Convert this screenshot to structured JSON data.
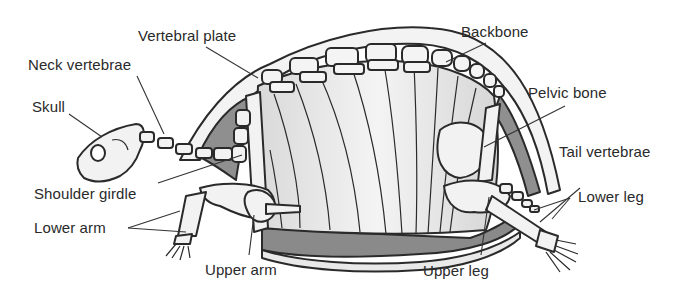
{
  "figure": {
    "labels": [
      {
        "id": "vertebral-plate",
        "text": "Vertebral plate"
      },
      {
        "id": "neck-vertebrae",
        "text": "Neck vertebrae"
      },
      {
        "id": "skull",
        "text": "Skull"
      },
      {
        "id": "backbone",
        "text": "Backbone"
      },
      {
        "id": "pelvic-bone",
        "text": "Pelvic bone"
      },
      {
        "id": "tail-vertebrae",
        "text": "Tail vertebrae"
      },
      {
        "id": "shoulder-girdle",
        "text": "Shoulder girdle"
      },
      {
        "id": "lower-arm",
        "text": "Lower arm"
      },
      {
        "id": "upper-arm",
        "text": "Upper arm"
      },
      {
        "id": "lower-leg",
        "text": "Lower leg"
      },
      {
        "id": "upper-leg",
        "text": "Upper leg"
      }
    ],
    "colors": {
      "outline": "#2a2a2a",
      "bone": "#f2f2f2",
      "shell_inner": "#e6e6e6",
      "shadow": "#8f8f8f",
      "dark_plastron": "#7d7d7d",
      "background": "#ffffff"
    }
  }
}
